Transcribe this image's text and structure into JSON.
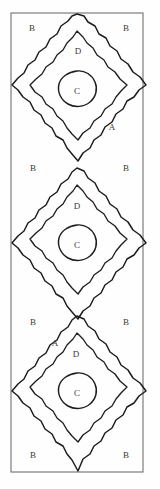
{
  "figure": {
    "type": "line-drawing",
    "background_color": "#fefefe",
    "ink_color": "#1d1d1d",
    "frame_color": "#6f6f6f",
    "label_color": "#3a3a3a"
  },
  "frame": {
    "x": 11,
    "y": 13,
    "width": 132,
    "height": 459
  },
  "zone_key": {
    "A": "outer diamond band",
    "B": "corner background field",
    "C": "central circle",
    "D": "inner diamond field"
  },
  "labels": [
    {
      "text": "B",
      "x": 32,
      "y": 28,
      "zone": "B",
      "motif": 1
    },
    {
      "text": "B",
      "x": 126,
      "y": 28,
      "zone": "B",
      "motif": 1
    },
    {
      "text": "D",
      "x": 78,
      "y": 51,
      "zone": "D",
      "motif": 1
    },
    {
      "text": "C",
      "x": 77,
      "y": 91,
      "zone": "C",
      "motif": 1
    },
    {
      "text": "A",
      "x": 112,
      "y": 127,
      "zone": "A",
      "motif": 1
    },
    {
      "text": "B",
      "x": 33,
      "y": 168,
      "zone": "B",
      "motif": 2
    },
    {
      "text": "B",
      "x": 126,
      "y": 168,
      "zone": "B",
      "motif": 2
    },
    {
      "text": "D",
      "x": 77,
      "y": 206,
      "zone": "D",
      "motif": 2
    },
    {
      "text": "C",
      "x": 77,
      "y": 245,
      "zone": "C",
      "motif": 2
    },
    {
      "text": "B",
      "x": 33,
      "y": 322,
      "zone": "B",
      "motif": 3
    },
    {
      "text": "B",
      "x": 126,
      "y": 322,
      "zone": "B",
      "motif": 3
    },
    {
      "text": "A",
      "x": 55,
      "y": 343,
      "zone": "A",
      "motif": 3
    },
    {
      "text": "D",
      "x": 76,
      "y": 354,
      "zone": "D",
      "motif": 3
    },
    {
      "text": "C",
      "x": 77,
      "y": 393,
      "zone": "C",
      "motif": 3
    },
    {
      "text": "B",
      "x": 33,
      "y": 455,
      "zone": "B",
      "motif": 3
    },
    {
      "text": "B",
      "x": 126,
      "y": 455,
      "zone": "B",
      "motif": 3
    }
  ],
  "motifs": [
    {
      "index": 1,
      "center_x": 77,
      "center_y": 91,
      "outer_rx": 70,
      "outer_ry": 78,
      "mid_rx": 54,
      "mid_ry": 60,
      "circle_r": 20
    },
    {
      "index": 2,
      "center_x": 77,
      "center_y": 245,
      "outer_rx": 70,
      "outer_ry": 78,
      "mid_rx": 54,
      "mid_ry": 60,
      "circle_r": 20
    },
    {
      "index": 3,
      "center_x": 77,
      "center_y": 393,
      "outer_rx": 70,
      "outer_ry": 78,
      "mid_rx": 54,
      "mid_ry": 60,
      "circle_r": 20
    }
  ]
}
